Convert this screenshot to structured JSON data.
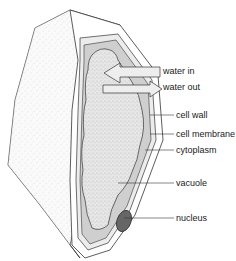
{
  "diagram": {
    "colors": {
      "outline": "#333333",
      "cell_wall_fill": "#ffffff",
      "wall_side_fill": "#f2f2f2",
      "cytoplasm_fill": "#cfcfcf",
      "membrane_fill": "#e8e8e8",
      "vacuole_fill": "#e4e4e4",
      "nucleus_fill": "#666666",
      "arrow_fill": "#eeeeee"
    },
    "arrows": [
      {
        "label": "water in",
        "direction": "left"
      },
      {
        "label": "water out",
        "direction": "right"
      }
    ],
    "labels": [
      {
        "text": "water in",
        "x": 163,
        "y": 71
      },
      {
        "text": "water out",
        "x": 163,
        "y": 86
      },
      {
        "text": "cell wall",
        "x": 176,
        "y": 111
      },
      {
        "text": "cell membrane",
        "x": 176,
        "y": 130
      },
      {
        "text": "cytoplasm",
        "x": 176,
        "y": 146
      },
      {
        "text": "vacuole",
        "x": 176,
        "y": 179
      },
      {
        "text": "nucleus",
        "x": 176,
        "y": 214
      }
    ]
  }
}
